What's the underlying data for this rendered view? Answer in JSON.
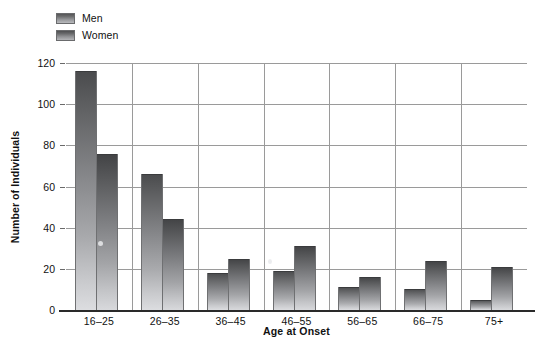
{
  "chart_data": {
    "type": "bar",
    "title": "",
    "xlabel": "Age at Onset",
    "ylabel": "Number of Individuals",
    "categories": [
      "16–25",
      "26–35",
      "36–45",
      "46–55",
      "56–65",
      "66–75",
      "75+"
    ],
    "series": [
      {
        "name": "Men",
        "values": [
          116,
          66,
          18,
          19,
          11,
          10,
          5
        ]
      },
      {
        "name": "Women",
        "values": [
          76,
          44,
          25,
          31,
          16,
          24,
          21
        ]
      }
    ],
    "ylim": [
      0,
      120
    ],
    "ytick_labels": [
      "120",
      "100",
      "80",
      "60",
      "40",
      "20",
      "0"
    ],
    "ytick_values": [
      120,
      100,
      80,
      60,
      40,
      20,
      0
    ],
    "grid": true,
    "legend_position": "top-left",
    "colors": {
      "men_bar_top": "#4a4b4d",
      "men_bar_bottom": "#dcdde0",
      "women_bar_top": "#424345",
      "women_bar_bottom": "#d8d9dc",
      "gridline": "#9a9a9a",
      "axis": "#2a2a2a",
      "text": "#111111",
      "background": "#ffffff"
    }
  },
  "legend": {
    "items": [
      {
        "label": "Men"
      },
      {
        "label": "Women"
      }
    ]
  }
}
